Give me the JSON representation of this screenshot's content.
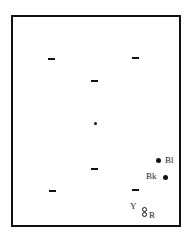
{
  "diagram": {
    "labels": {
      "blue": "Bl",
      "black": "Bk",
      "yellow": "Y",
      "red": "R"
    },
    "markers": {
      "dashes": [
        {
          "x": 48,
          "y": 59
        },
        {
          "x": 133,
          "y": 58
        },
        {
          "x": 91,
          "y": 81
        },
        {
          "x": 91,
          "y": 168
        },
        {
          "x": 49,
          "y": 190
        },
        {
          "x": 132,
          "y": 190
        }
      ],
      "dots": [
        {
          "x": 95,
          "y": 123,
          "size": 3
        },
        {
          "x": 157,
          "y": 160,
          "size": 5,
          "label": "Bl"
        },
        {
          "x": 165,
          "y": 177,
          "size": 5,
          "label": "Bk"
        }
      ]
    }
  }
}
